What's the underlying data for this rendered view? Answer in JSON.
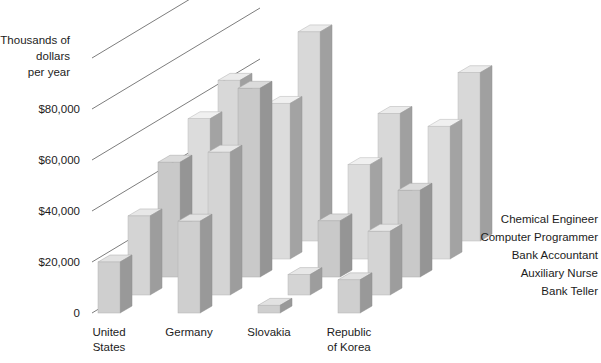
{
  "chart_data": {
    "type": "bar",
    "title": "",
    "subtitle": "",
    "ylabel": "Thousands of dollars per year",
    "ylabel_lines": [
      "Thousands of",
      "dollars",
      "per year"
    ],
    "xlabel": "",
    "projection": "3d-grouped-bars",
    "categories": [
      "United States",
      "Germany",
      "Slovakia",
      "Republic of Korea"
    ],
    "category_lines": [
      [
        "United",
        "States"
      ],
      [
        "Germany"
      ],
      [
        "Slovakia"
      ],
      [
        "Republic",
        "of Korea"
      ]
    ],
    "series": [
      {
        "name": "Bank Teller",
        "color": "#cfcfcf",
        "values": [
          20000,
          36000,
          3000,
          13000
        ]
      },
      {
        "name": "Auxiliary Nurse",
        "color": "#d4d4d4",
        "values": [
          31000,
          56000,
          8000,
          25000
        ]
      },
      {
        "name": "Bank Accountant",
        "color": "#c9c9c9",
        "values": [
          45000,
          74000,
          22000,
          34000
        ]
      },
      {
        "name": "Computer Programmer",
        "color": "#dcdcdc",
        "values": [
          55000,
          61000,
          37000,
          52000
        ]
      },
      {
        "name": "Chemical Engineer",
        "color": "#d8d8d8",
        "values": [
          63000,
          82000,
          50000,
          66000
        ]
      }
    ],
    "ylim": [
      0,
      100000
    ],
    "ytick_values": [
      0,
      20000,
      40000,
      60000,
      80000
    ],
    "ytick_labels": [
      "0",
      "$20,000",
      "$40,000",
      "$60,000",
      "$80,000"
    ],
    "grid": true,
    "grid_orientation": "depth-diagonal",
    "legend_position": "right-inline-depth",
    "legend_entries": [
      "Chemical Engineer",
      "Computer Programmer",
      "Bank Accountant",
      "Auxiliary Nurse",
      "Bank Teller"
    ],
    "colors": {
      "bar_front": "#d2d2d2",
      "bar_side": "#9b9b9b",
      "bar_top": "#e6e6e6",
      "grid": "#6e6e6e",
      "text": "#1c1c1c",
      "background": "#ffffff"
    }
  }
}
